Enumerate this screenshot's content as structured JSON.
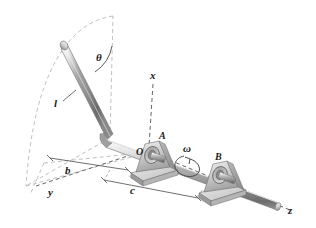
{
  "figure": {
    "background_color": "#ffffff",
    "line_color": "#7f7f7f",
    "label_color": "#1a1a1a",
    "metal_light": "#f2f2f2",
    "metal_mid": "#b8b8b8",
    "metal_dark": "#6e6e6e",
    "shadow_color": "#c9c9c9"
  },
  "labels": {
    "theta": "θ",
    "length_l": "l",
    "axis_x": "x",
    "axis_y": "y",
    "axis_z": "z",
    "point_A": "A",
    "point_O": "O",
    "point_B": "B",
    "omega": "ω",
    "dim_b": "b",
    "dim_c": "c"
  },
  "parts": {
    "rod": "inclined-rod",
    "shaft": "horizontal-shaft",
    "bearing_a": "pillow-block-bearing-a",
    "bearing_b": "pillow-block-bearing-b",
    "swept_arc": "rod-sweep-arc",
    "ground_plane": "ground-reference-plane"
  }
}
